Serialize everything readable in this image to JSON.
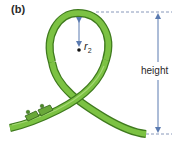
{
  "figure": {
    "panel_label": "(b)",
    "radius_label": {
      "symbol": "r",
      "subscript": "2"
    },
    "height_label": "height",
    "elements": [
      "loop-track",
      "radius-arrow",
      "center-dot",
      "height-arrow",
      "top-dashed-line",
      "bottom-dashed-line",
      "coaster-cars"
    ]
  },
  "colors": {
    "track_outer": "#3f7a1e",
    "track_fill": "#7cc243",
    "track_highlight": "#b7e08a",
    "arrow": "#5a7ab0",
    "dash": "#6b7fa8",
    "text": "#2a2a2a",
    "car": "#6aa83a"
  }
}
